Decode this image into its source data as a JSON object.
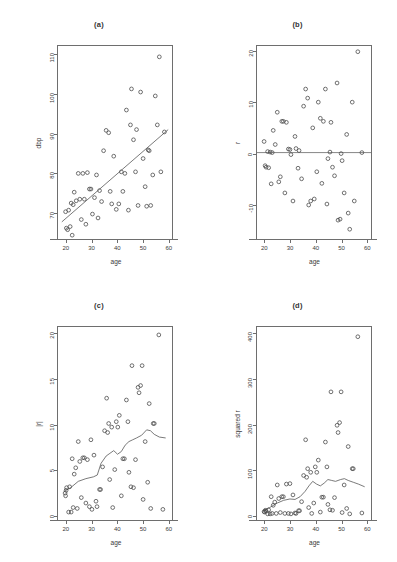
{
  "figure": {
    "layout": "2x2 grid of diagnostic scatter plots",
    "background": "#ffffff",
    "point_color": "#4a4a4a",
    "line_color": "#555555"
  },
  "chart_data": [
    {
      "type": "scatter",
      "panel": "a",
      "title": "(a)",
      "xlabel": "age",
      "ylabel": "dbp",
      "xlim": [
        17,
        62
      ],
      "ylim": [
        63,
        112
      ],
      "xticks": [
        20,
        30,
        40,
        50,
        60
      ],
      "yticks": [
        70,
        80,
        90,
        100,
        110
      ],
      "grid": false,
      "overlay": {
        "type": "regression-line",
        "x": [
          18.5,
          60.5
        ],
        "y": [
          67.2,
          90.8
        ]
      },
      "points": [
        [
          20.0,
          69.8
        ],
        [
          20.3,
          65.6
        ],
        [
          20.8,
          65.2
        ],
        [
          21.2,
          70.2
        ],
        [
          21.8,
          66.0
        ],
        [
          22.2,
          72.0
        ],
        [
          22.6,
          63.8
        ],
        [
          23.0,
          71.6
        ],
        [
          23.4,
          74.8
        ],
        [
          24.2,
          72.6
        ],
        [
          25.0,
          79.6
        ],
        [
          25.6,
          73.0
        ],
        [
          26.2,
          67.8
        ],
        [
          26.8,
          79.6
        ],
        [
          27.4,
          73.0
        ],
        [
          28.0,
          66.6
        ],
        [
          28.6,
          79.8
        ],
        [
          29.4,
          75.6
        ],
        [
          30.0,
          75.6
        ],
        [
          30.6,
          69.2
        ],
        [
          31.4,
          73.4
        ],
        [
          32.2,
          79.2
        ],
        [
          32.8,
          68.2
        ],
        [
          33.4,
          75.2
        ],
        [
          34.2,
          72.4
        ],
        [
          35.0,
          85.4
        ],
        [
          36.0,
          90.6
        ],
        [
          37.0,
          90.0
        ],
        [
          37.6,
          75.0
        ],
        [
          38.2,
          71.8
        ],
        [
          39.0,
          84.0
        ],
        [
          40.0,
          70.4
        ],
        [
          41.0,
          71.8
        ],
        [
          42.0,
          80.0
        ],
        [
          42.6,
          75.0
        ],
        [
          43.4,
          79.6
        ],
        [
          44.0,
          95.8
        ],
        [
          44.8,
          70.2
        ],
        [
          45.6,
          92.0
        ],
        [
          46.0,
          101.2
        ],
        [
          46.8,
          88.2
        ],
        [
          47.6,
          80.0
        ],
        [
          48.0,
          90.8
        ],
        [
          48.6,
          71.4
        ],
        [
          49.6,
          100.4
        ],
        [
          50.6,
          83.4
        ],
        [
          51.4,
          76.2
        ],
        [
          52.0,
          71.2
        ],
        [
          52.6,
          85.6
        ],
        [
          53.0,
          85.4
        ],
        [
          53.6,
          71.4
        ],
        [
          54.4,
          79.2
        ],
        [
          55.4,
          99.4
        ],
        [
          56.2,
          92.0
        ],
        [
          57.0,
          109.4
        ],
        [
          57.6,
          80.0
        ],
        [
          59.0,
          90.2
        ]
      ]
    },
    {
      "type": "scatter",
      "panel": "b",
      "title": "(b)",
      "xlabel": "age",
      "ylabel": "r",
      "xlim": [
        17,
        62
      ],
      "ylim": [
        -17,
        21
      ],
      "xticks": [
        20,
        30,
        40,
        50,
        60
      ],
      "yticks": [
        -10,
        0,
        10,
        20
      ],
      "grid": false,
      "overlay": {
        "type": "zero-line",
        "y": 0
      },
      "points": [
        [
          19.8,
          2.2
        ],
        [
          20.2,
          -2.6
        ],
        [
          20.6,
          -2.9
        ],
        [
          21.2,
          0.2
        ],
        [
          21.6,
          -3.0
        ],
        [
          22.2,
          0.1
        ],
        [
          22.6,
          -6.2
        ],
        [
          23.0,
          0.0
        ],
        [
          23.4,
          4.4
        ],
        [
          24.2,
          1.6
        ],
        [
          25.0,
          8.0
        ],
        [
          25.6,
          -5.8
        ],
        [
          26.2,
          -4.8
        ],
        [
          26.8,
          6.2
        ],
        [
          27.4,
          6.2
        ],
        [
          28.0,
          -8.0
        ],
        [
          28.6,
          6.0
        ],
        [
          29.4,
          0.7
        ],
        [
          30.0,
          0.6
        ],
        [
          30.4,
          -0.4
        ],
        [
          31.2,
          -9.6
        ],
        [
          32.0,
          3.2
        ],
        [
          32.4,
          0.8
        ],
        [
          33.2,
          -3.1
        ],
        [
          33.6,
          0.4
        ],
        [
          34.6,
          -5.2
        ],
        [
          35.4,
          9.2
        ],
        [
          36.2,
          12.6
        ],
        [
          37.0,
          10.8
        ],
        [
          37.4,
          -10.4
        ],
        [
          38.2,
          -9.6
        ],
        [
          39.0,
          4.9
        ],
        [
          39.6,
          -9.2
        ],
        [
          40.6,
          -3.8
        ],
        [
          41.2,
          10.0
        ],
        [
          42.0,
          6.8
        ],
        [
          42.6,
          -6.1
        ],
        [
          43.2,
          6.2
        ],
        [
          44.0,
          12.6
        ],
        [
          44.6,
          -10.2
        ],
        [
          45.0,
          -1.2
        ],
        [
          45.8,
          0.1
        ],
        [
          46.2,
          6.0
        ],
        [
          46.8,
          -2.9
        ],
        [
          47.6,
          -4.6
        ],
        [
          48.6,
          13.8
        ],
        [
          49.0,
          -13.4
        ],
        [
          49.8,
          -13.2
        ],
        [
          50.2,
          -0.2
        ],
        [
          50.6,
          -1.6
        ],
        [
          51.4,
          -8.0
        ],
        [
          52.4,
          3.6
        ],
        [
          53.0,
          -12.0
        ],
        [
          53.6,
          -15.2
        ],
        [
          54.6,
          10.0
        ],
        [
          55.4,
          -9.6
        ],
        [
          56.8,
          20.0
        ],
        [
          58.4,
          0.0
        ]
      ]
    },
    {
      "type": "scatter",
      "panel": "c",
      "title": "(c)",
      "xlabel": "age",
      "ylabel": "|r|",
      "xlim": [
        17,
        62
      ],
      "ylim": [
        -0.6,
        20.6
      ],
      "xticks": [
        20,
        30,
        40,
        50,
        60
      ],
      "yticks": [
        0,
        5,
        10,
        15,
        20
      ],
      "grid": false,
      "overlay": {
        "type": "lowess",
        "x": [
          19.5,
          22,
          25,
          28,
          31,
          32.5,
          34,
          36,
          37.5,
          39,
          40.5,
          42,
          43.5,
          45,
          46.5,
          48,
          50,
          52,
          53.5,
          55,
          57,
          59.5
        ],
        "y": [
          2.5,
          2.9,
          3.6,
          3.9,
          4.1,
          4.3,
          5.6,
          6.4,
          6.7,
          7.0,
          6.6,
          6.9,
          7.6,
          8.0,
          8.2,
          8.4,
          8.7,
          9.3,
          9.2,
          8.8,
          8.5,
          8.4
        ]
      },
      "points": [
        [
          19.8,
          2.3
        ],
        [
          20.0,
          2.0
        ],
        [
          20.2,
          2.6
        ],
        [
          20.4,
          2.9
        ],
        [
          21.2,
          0.2
        ],
        [
          21.6,
          3.0
        ],
        [
          22.2,
          0.2
        ],
        [
          22.6,
          6.1
        ],
        [
          23.0,
          0.7
        ],
        [
          23.4,
          4.4
        ],
        [
          24.0,
          5.1
        ],
        [
          24.6,
          0.6
        ],
        [
          25.0,
          8.0
        ],
        [
          25.6,
          5.8
        ],
        [
          26.2,
          1.8
        ],
        [
          26.8,
          6.2
        ],
        [
          27.4,
          6.2
        ],
        [
          28.0,
          1.2
        ],
        [
          28.6,
          6.0
        ],
        [
          29.4,
          0.8
        ],
        [
          30.0,
          8.2
        ],
        [
          30.4,
          0.5
        ],
        [
          31.2,
          6.5
        ],
        [
          32.0,
          1.4
        ],
        [
          32.4,
          0.8
        ],
        [
          33.4,
          2.7
        ],
        [
          33.8,
          2.7
        ],
        [
          34.6,
          5.2
        ],
        [
          35.4,
          9.2
        ],
        [
          36.2,
          12.8
        ],
        [
          36.6,
          9.0
        ],
        [
          37.0,
          10.0
        ],
        [
          37.4,
          3.8
        ],
        [
          38.2,
          9.6
        ],
        [
          38.6,
          0.7
        ],
        [
          39.4,
          4.9
        ],
        [
          40.0,
          10.2
        ],
        [
          40.6,
          9.6
        ],
        [
          41.2,
          10.9
        ],
        [
          42.0,
          2.0
        ],
        [
          42.6,
          6.1
        ],
        [
          43.2,
          6.1
        ],
        [
          44.0,
          12.6
        ],
        [
          44.6,
          10.2
        ],
        [
          45.0,
          4.6
        ],
        [
          45.8,
          3.0
        ],
        [
          46.2,
          16.4
        ],
        [
          46.8,
          2.9
        ],
        [
          47.6,
          6.0
        ],
        [
          48.6,
          14.0
        ],
        [
          49.0,
          13.4
        ],
        [
          49.6,
          14.2
        ],
        [
          50.2,
          16.4
        ],
        [
          50.6,
          1.6
        ],
        [
          51.4,
          8.0
        ],
        [
          52.4,
          3.5
        ],
        [
          53.0,
          12.2
        ],
        [
          53.6,
          0.6
        ],
        [
          54.6,
          10.0
        ],
        [
          55.0,
          10.0
        ],
        [
          56.8,
          19.8
        ],
        [
          58.4,
          0.5
        ]
      ]
    },
    {
      "type": "scatter",
      "panel": "d",
      "title": "(d)",
      "xlabel": "age",
      "ylabel": "squared r",
      "xlim": [
        17,
        62
      ],
      "ylim": [
        -12,
        412
      ],
      "xticks": [
        20,
        30,
        40,
        50,
        60
      ],
      "yticks": [
        0,
        100,
        200,
        300,
        400
      ],
      "grid": false,
      "overlay": {
        "type": "lowess",
        "x": [
          19.5,
          22,
          25,
          27.5,
          30,
          32,
          34,
          36,
          37.5,
          39,
          40.5,
          42,
          43.5,
          45,
          46.5,
          48,
          50,
          51.5,
          53,
          55,
          57,
          59.5
        ],
        "y": [
          8,
          14,
          24,
          30,
          33,
          32,
          38,
          50,
          62,
          72,
          66,
          62,
          68,
          76,
          74,
          72,
          76,
          78,
          74,
          70,
          66,
          60
        ]
      },
      "points": [
        [
          19.8,
          5
        ],
        [
          20.0,
          4
        ],
        [
          20.3,
          8
        ],
        [
          20.6,
          6
        ],
        [
          21.2,
          0
        ],
        [
          21.6,
          9
        ],
        [
          22.2,
          0
        ],
        [
          22.6,
          38
        ],
        [
          23.0,
          1
        ],
        [
          23.4,
          19
        ],
        [
          24.0,
          26
        ],
        [
          24.6,
          1
        ],
        [
          25.0,
          64
        ],
        [
          25.6,
          34
        ],
        [
          26.2,
          3
        ],
        [
          26.8,
          38
        ],
        [
          27.4,
          38
        ],
        [
          28.0,
          1
        ],
        [
          28.6,
          66
        ],
        [
          29.4,
          1
        ],
        [
          30.0,
          67
        ],
        [
          30.4,
          0
        ],
        [
          31.2,
          42
        ],
        [
          32.0,
          2
        ],
        [
          32.4,
          1
        ],
        [
          33.4,
          7
        ],
        [
          33.8,
          7
        ],
        [
          34.6,
          27
        ],
        [
          35.4,
          85
        ],
        [
          36.2,
          164
        ],
        [
          36.6,
          81
        ],
        [
          37.0,
          100
        ],
        [
          37.4,
          14
        ],
        [
          38.2,
          92
        ],
        [
          38.6,
          1
        ],
        [
          39.4,
          24
        ],
        [
          40.0,
          104
        ],
        [
          40.6,
          92
        ],
        [
          41.2,
          119
        ],
        [
          42.0,
          4
        ],
        [
          42.6,
          37
        ],
        [
          43.2,
          37
        ],
        [
          44.0,
          159
        ],
        [
          44.6,
          104
        ],
        [
          45.0,
          21
        ],
        [
          45.8,
          9
        ],
        [
          46.2,
          270
        ],
        [
          46.8,
          8
        ],
        [
          47.6,
          36
        ],
        [
          48.6,
          196
        ],
        [
          49.0,
          180
        ],
        [
          49.6,
          202
        ],
        [
          50.2,
          270
        ],
        [
          50.6,
          3
        ],
        [
          51.4,
          64
        ],
        [
          52.4,
          12
        ],
        [
          53.0,
          149
        ],
        [
          53.6,
          0
        ],
        [
          54.6,
          100
        ],
        [
          55.0,
          100
        ],
        [
          56.8,
          392
        ],
        [
          58.4,
          2
        ]
      ]
    }
  ]
}
